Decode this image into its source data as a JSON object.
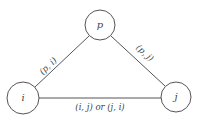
{
  "diagram": {
    "type": "graph",
    "nodes": [
      {
        "id": "p",
        "label": "p",
        "cx": 100,
        "cy": 25,
        "r": 15
      },
      {
        "id": "i",
        "label": "i",
        "cx": 23,
        "cy": 98,
        "r": 16
      },
      {
        "id": "j",
        "label": "j",
        "cx": 176,
        "cy": 97,
        "r": 15
      }
    ],
    "edges": [
      {
        "from": "p",
        "to": "i",
        "label": "(p, i)"
      },
      {
        "from": "p",
        "to": "j",
        "label": "(p, j)"
      },
      {
        "from": "i",
        "to": "j",
        "label": "(i, j) or (j, i)"
      }
    ],
    "colors": {
      "stroke": "#555555",
      "text": "#444444",
      "background": "#ffffff"
    }
  }
}
